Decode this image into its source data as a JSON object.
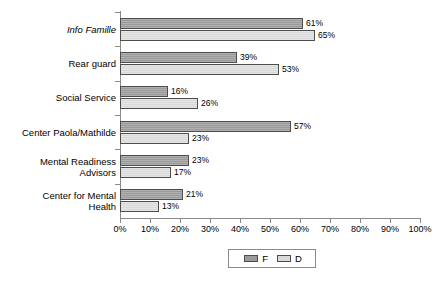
{
  "chart_data": {
    "type": "bar",
    "orientation": "horizontal",
    "title": "",
    "subtitle": "",
    "xlabel": "",
    "ylabel": "",
    "xlim": [
      0,
      100
    ],
    "grid": false,
    "legend_position": "bottom",
    "value_suffix": "%",
    "categories": [
      "Info Famille",
      "Rear guard",
      "Social Service",
      "Center Paola/Mathilde",
      "Mental Readiness\nAdvisors",
      "Center for Mental\nHealth"
    ],
    "series": [
      {
        "name": "F",
        "color": "#9a9a9a",
        "values": [
          61,
          39,
          16,
          57,
          23,
          21
        ]
      },
      {
        "name": "D",
        "color": "#d9d9d9",
        "values": [
          65,
          53,
          26,
          23,
          17,
          13
        ]
      }
    ],
    "x_ticks": [
      "0%",
      "10%",
      "20%",
      "30%",
      "40%",
      "50%",
      "60%",
      "70%",
      "80%",
      "90%",
      "100%"
    ],
    "x_tick_values": [
      0,
      10,
      20,
      30,
      40,
      50,
      60,
      70,
      80,
      90,
      100
    ],
    "data_labels": {
      "F": [
        "61%",
        "39%",
        "16%",
        "57%",
        "23%",
        "21%"
      ],
      "D": [
        "65%",
        "53%",
        "26%",
        "23%",
        "17%",
        "13%"
      ]
    },
    "legend": [
      "F",
      "D"
    ],
    "axis_color": "#8a8a8a",
    "bar_border_color": "#4d4d4d",
    "background": "#ffffff"
  }
}
